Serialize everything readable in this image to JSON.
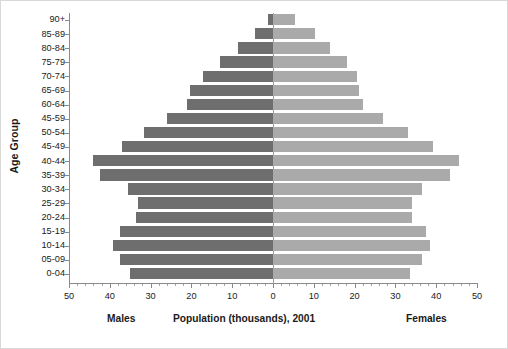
{
  "chart_data": {
    "type": "bar",
    "title": "",
    "subtitle": "",
    "orientation": "horizontal",
    "layout": "population-pyramid",
    "xlabel": "Population (thousands), 2001",
    "ylabel": "Age Group",
    "xlim": [
      -50,
      50
    ],
    "x_axis_absolute_ticks": [
      50,
      40,
      30,
      20,
      10,
      0,
      10,
      20,
      30,
      40,
      50
    ],
    "x_tick_labels": [
      "50",
      "40",
      "30",
      "20",
      "10",
      "0",
      "10",
      "20",
      "30",
      "40",
      "50"
    ],
    "x_minor_tick_step": 2,
    "grid": false,
    "legend": "none",
    "left_side_label": "Males",
    "right_side_label": "Females",
    "categories": [
      "90+",
      "85-89",
      "80-84",
      "75-79",
      "70-74",
      "65-69",
      "60-64",
      "45-59",
      "50-54",
      "45-49",
      "40-44",
      "35-39",
      "30-34",
      "25-29",
      "20-24",
      "15-19",
      "10-14",
      "05-09",
      "0-04"
    ],
    "series": [
      {
        "name": "Males",
        "direction": "left",
        "color": "#6e6e6e",
        "values": [
          1.2,
          4.3,
          8.6,
          13.0,
          17.2,
          20.3,
          21.0,
          26.0,
          31.5,
          37.0,
          44.2,
          42.5,
          35.5,
          33.0,
          33.5,
          37.5,
          39.2,
          37.5,
          35.0
        ]
      },
      {
        "name": "Females",
        "direction": "right",
        "color": "#aaaaaa",
        "values": [
          5.4,
          10.3,
          14.0,
          18.2,
          20.5,
          21.0,
          22.0,
          27.0,
          33.0,
          39.2,
          45.5,
          43.5,
          36.5,
          34.0,
          34.0,
          37.5,
          38.5,
          36.5,
          33.5
        ]
      }
    ]
  },
  "colors": {
    "male_bar": "#6e6e6e",
    "female_bar": "#aaaaaa",
    "axis": "#8a8a8a",
    "text": "#1a1a1a",
    "background": "#ffffff"
  }
}
